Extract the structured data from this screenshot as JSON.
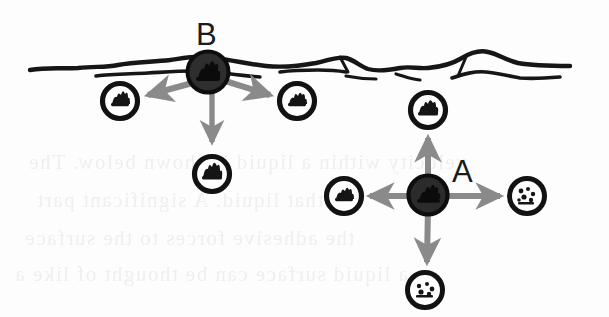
{
  "figure": {
    "background_color": "#fdfdfd",
    "width": 609,
    "height": 317,
    "caption": "",
    "kind": "scanned-textbook-line-diagram"
  },
  "palette": {
    "ink": "#161616",
    "arrow_gray": "#8a8a8a",
    "molecule_fill_dark": "#2c2c2c",
    "molecule_ring": "#121212",
    "paper": "#fdfdfd",
    "ghost_text": "#ededed"
  },
  "labels": {
    "surface_molecule": "B",
    "interior_molecule": "A"
  },
  "surface": {
    "name": "liquid-surface-line",
    "description": "hand-drawn wavy double line representing the liquid surface"
  },
  "molecules": {
    "surface_center": {
      "id": "molecule-B",
      "label": "B",
      "cx": 208,
      "cy": 72,
      "r": 21,
      "style": "filled-dark",
      "position": "at liquid surface"
    },
    "interior_center": {
      "id": "molecule-A",
      "label": "A",
      "cx": 428,
      "cy": 195,
      "r": 20,
      "style": "filled-dark",
      "position": "inside liquid"
    },
    "neighbors": [
      {
        "id": "neighbor-B-left",
        "cx": 120,
        "cy": 101,
        "r": 19,
        "style": "ring-blob"
      },
      {
        "id": "neighbor-B-right",
        "cx": 297,
        "cy": 101,
        "r": 19,
        "style": "ring-blob"
      },
      {
        "id": "neighbor-B-below",
        "cx": 212,
        "cy": 174,
        "r": 19,
        "style": "ring-blob"
      },
      {
        "id": "neighbor-A-above",
        "cx": 428,
        "cy": 110,
        "r": 19,
        "style": "ring-blob"
      },
      {
        "id": "neighbor-A-left",
        "cx": 344,
        "cy": 196,
        "r": 19,
        "style": "ring-blob"
      },
      {
        "id": "neighbor-A-right",
        "cx": 527,
        "cy": 196,
        "r": 19,
        "style": "ring-blob"
      },
      {
        "id": "neighbor-A-below",
        "cx": 425,
        "cy": 290,
        "r": 19,
        "style": "ring-blob"
      }
    ]
  },
  "force_arrows": {
    "from_B": [
      {
        "id": "arrow-B-left",
        "direction": "down-left",
        "x1": 200,
        "y1": 82,
        "x2": 143,
        "y2": 96
      },
      {
        "id": "arrow-B-right",
        "direction": "down-right",
        "x1": 222,
        "y1": 80,
        "x2": 274,
        "y2": 96
      },
      {
        "id": "arrow-B-down",
        "direction": "down",
        "x1": 212,
        "y1": 86,
        "x2": 212,
        "y2": 148
      }
    ],
    "from_A": [
      {
        "id": "arrow-A-up",
        "direction": "up",
        "x1": 428,
        "y1": 182,
        "x2": 428,
        "y2": 133
      },
      {
        "id": "arrow-A-down",
        "direction": "down",
        "x1": 428,
        "y1": 208,
        "x2": 426,
        "y2": 266
      },
      {
        "id": "arrow-A-left",
        "direction": "left",
        "x1": 411,
        "y1": 196,
        "x2": 367,
        "y2": 196
      },
      {
        "id": "arrow-A-right",
        "direction": "right",
        "x1": 446,
        "y1": 196,
        "x2": 503,
        "y2": 196
      }
    ]
  },
  "ghost_text": {
    "note": "faint bleed-through text from the reverse side of the scanned page",
    "lines": [
      {
        "text": "velocity within a liquid is shown below. The",
        "left": 28,
        "top": 150
      },
      {
        "text": "that liquid. A significant part",
        "left": 36,
        "top": 188
      },
      {
        "text": "the adhesive forces to the surface",
        "left": 24,
        "top": 226
      },
      {
        "text": "a liquid surface can be thought of like a",
        "left": 14,
        "top": 262
      }
    ]
  }
}
